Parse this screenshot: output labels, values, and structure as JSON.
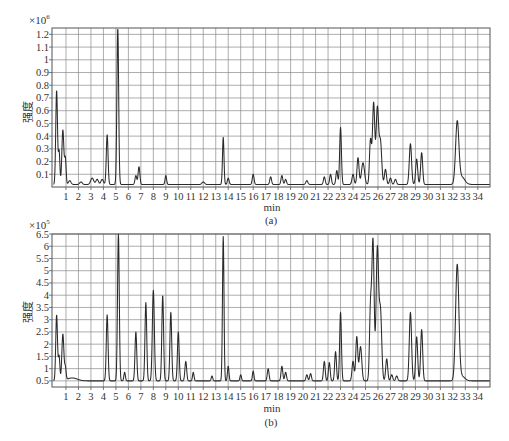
{
  "figure": {
    "panels": [
      {
        "id": "a",
        "caption": "(a)",
        "xlabel": "min",
        "ylabel": "强度",
        "y_multiplier": "×10",
        "y_exponent": "6"
      },
      {
        "id": "b",
        "caption": "(b)",
        "xlabel": "min",
        "ylabel": "强度",
        "y_multiplier": "×10",
        "y_exponent": "5"
      }
    ]
  },
  "chart_data": [
    {
      "type": "line",
      "title": "(a)",
      "xlabel": "min",
      "ylabel": "强度 (×10^6)",
      "xlim": [
        0,
        35
      ],
      "ylim": [
        0,
        1.25
      ],
      "x_ticks": [
        1,
        2,
        3,
        4,
        5,
        6,
        7,
        8,
        9,
        10,
        11,
        12,
        13,
        14,
        15,
        16,
        17,
        18,
        19,
        20,
        21,
        22,
        23,
        24,
        25,
        26,
        27,
        28,
        29,
        30,
        31,
        32,
        33,
        34
      ],
      "y_ticks": [
        0.1,
        0.2,
        0.3,
        0.4,
        0.5,
        0.6,
        0.7,
        0.8,
        0.9,
        1,
        1.1,
        1.2
      ],
      "grid": true,
      "baseline": 0.02,
      "peaks": [
        {
          "x": 0.25,
          "y": 0.76,
          "w": 0.07
        },
        {
          "x": 0.45,
          "y": 0.28,
          "w": 0.06
        },
        {
          "x": 0.75,
          "y": 0.45,
          "w": 0.08
        },
        {
          "x": 0.95,
          "y": 0.22,
          "w": 0.06
        },
        {
          "x": 1.3,
          "y": 0.05,
          "w": 0.1
        },
        {
          "x": 2.2,
          "y": 0.04,
          "w": 0.1
        },
        {
          "x": 3.1,
          "y": 0.07,
          "w": 0.12
        },
        {
          "x": 3.5,
          "y": 0.06,
          "w": 0.1
        },
        {
          "x": 3.9,
          "y": 0.06,
          "w": 0.1
        },
        {
          "x": 4.3,
          "y": 0.41,
          "w": 0.07
        },
        {
          "x": 5.15,
          "y": 1.25,
          "w": 0.07
        },
        {
          "x": 6.6,
          "y": 0.09,
          "w": 0.07
        },
        {
          "x": 6.85,
          "y": 0.16,
          "w": 0.07
        },
        {
          "x": 9.0,
          "y": 0.09,
          "w": 0.06
        },
        {
          "x": 12.0,
          "y": 0.04,
          "w": 0.1
        },
        {
          "x": 13.6,
          "y": 0.39,
          "w": 0.06
        },
        {
          "x": 14.0,
          "y": 0.07,
          "w": 0.07
        },
        {
          "x": 16.0,
          "y": 0.1,
          "w": 0.07
        },
        {
          "x": 17.4,
          "y": 0.08,
          "w": 0.07
        },
        {
          "x": 18.3,
          "y": 0.09,
          "w": 0.07
        },
        {
          "x": 18.6,
          "y": 0.06,
          "w": 0.07
        },
        {
          "x": 20.3,
          "y": 0.05,
          "w": 0.08
        },
        {
          "x": 21.7,
          "y": 0.08,
          "w": 0.07
        },
        {
          "x": 22.2,
          "y": 0.1,
          "w": 0.07
        },
        {
          "x": 22.7,
          "y": 0.13,
          "w": 0.07
        },
        {
          "x": 23.0,
          "y": 0.47,
          "w": 0.07
        },
        {
          "x": 24.0,
          "y": 0.1,
          "w": 0.08
        },
        {
          "x": 24.4,
          "y": 0.23,
          "w": 0.08
        },
        {
          "x": 24.8,
          "y": 0.19,
          "w": 0.12
        },
        {
          "x": 25.4,
          "y": 0.37,
          "w": 0.08
        },
        {
          "x": 25.65,
          "y": 0.66,
          "w": 0.09
        },
        {
          "x": 25.95,
          "y": 0.62,
          "w": 0.1
        },
        {
          "x": 26.2,
          "y": 0.35,
          "w": 0.1
        },
        {
          "x": 26.6,
          "y": 0.14,
          "w": 0.08
        },
        {
          "x": 27.0,
          "y": 0.07,
          "w": 0.08
        },
        {
          "x": 27.4,
          "y": 0.06,
          "w": 0.08
        },
        {
          "x": 28.6,
          "y": 0.34,
          "w": 0.09
        },
        {
          "x": 29.1,
          "y": 0.22,
          "w": 0.08
        },
        {
          "x": 29.5,
          "y": 0.27,
          "w": 0.08
        },
        {
          "x": 32.35,
          "y": 0.5,
          "w": 0.13
        },
        {
          "x": 32.7,
          "y": 0.08,
          "w": 0.25
        }
      ]
    },
    {
      "type": "line",
      "title": "(b)",
      "xlabel": "min",
      "ylabel": "强度 (×10^5)",
      "xlim": [
        0,
        35
      ],
      "ylim": [
        0.25,
        6.5
      ],
      "x_ticks": [
        1,
        2,
        3,
        4,
        5,
        6,
        7,
        8,
        9,
        10,
        11,
        12,
        13,
        14,
        15,
        16,
        17,
        18,
        19,
        20,
        21,
        22,
        23,
        24,
        25,
        26,
        27,
        28,
        29,
        30,
        31,
        32,
        33,
        34
      ],
      "y_ticks": [
        0.5,
        1,
        1.5,
        2,
        2.5,
        3,
        3.5,
        4,
        4.5,
        5,
        5.5,
        6,
        6.5
      ],
      "grid": true,
      "baseline": 0.5,
      "peaks": [
        {
          "x": 0.25,
          "y": 3.2,
          "w": 0.07
        },
        {
          "x": 0.45,
          "y": 1.5,
          "w": 0.06
        },
        {
          "x": 0.75,
          "y": 2.4,
          "w": 0.08
        },
        {
          "x": 0.95,
          "y": 1.0,
          "w": 0.06
        },
        {
          "x": 1.5,
          "y": 0.62,
          "w": 0.4
        },
        {
          "x": 4.3,
          "y": 3.2,
          "w": 0.07
        },
        {
          "x": 5.2,
          "y": 6.5,
          "w": 0.07
        },
        {
          "x": 5.7,
          "y": 0.85,
          "w": 0.06
        },
        {
          "x": 6.6,
          "y": 2.5,
          "w": 0.07
        },
        {
          "x": 7.4,
          "y": 3.7,
          "w": 0.07
        },
        {
          "x": 8.0,
          "y": 4.2,
          "w": 0.08
        },
        {
          "x": 8.75,
          "y": 4.0,
          "w": 0.07
        },
        {
          "x": 9.4,
          "y": 3.3,
          "w": 0.07
        },
        {
          "x": 10.0,
          "y": 2.5,
          "w": 0.07
        },
        {
          "x": 10.6,
          "y": 1.3,
          "w": 0.07
        },
        {
          "x": 11.2,
          "y": 0.85,
          "w": 0.06
        },
        {
          "x": 12.7,
          "y": 0.7,
          "w": 0.06
        },
        {
          "x": 13.6,
          "y": 6.4,
          "w": 0.06
        },
        {
          "x": 14.0,
          "y": 1.1,
          "w": 0.06
        },
        {
          "x": 15.0,
          "y": 0.75,
          "w": 0.06
        },
        {
          "x": 16.0,
          "y": 0.9,
          "w": 0.06
        },
        {
          "x": 17.2,
          "y": 1.0,
          "w": 0.07
        },
        {
          "x": 18.3,
          "y": 1.1,
          "w": 0.07
        },
        {
          "x": 18.6,
          "y": 0.85,
          "w": 0.07
        },
        {
          "x": 20.3,
          "y": 0.75,
          "w": 0.07
        },
        {
          "x": 20.6,
          "y": 0.8,
          "w": 0.07
        },
        {
          "x": 21.7,
          "y": 1.3,
          "w": 0.07
        },
        {
          "x": 22.1,
          "y": 1.25,
          "w": 0.07
        },
        {
          "x": 22.6,
          "y": 1.7,
          "w": 0.07
        },
        {
          "x": 23.0,
          "y": 3.3,
          "w": 0.07
        },
        {
          "x": 24.0,
          "y": 1.3,
          "w": 0.08
        },
        {
          "x": 24.3,
          "y": 2.3,
          "w": 0.08
        },
        {
          "x": 24.6,
          "y": 1.9,
          "w": 0.1
        },
        {
          "x": 25.4,
          "y": 3.4,
          "w": 0.08
        },
        {
          "x": 25.6,
          "y": 6.2,
          "w": 0.09
        },
        {
          "x": 25.95,
          "y": 5.9,
          "w": 0.1
        },
        {
          "x": 26.2,
          "y": 3.3,
          "w": 0.1
        },
        {
          "x": 26.7,
          "y": 1.4,
          "w": 0.08
        },
        {
          "x": 27.1,
          "y": 0.75,
          "w": 0.08
        },
        {
          "x": 27.5,
          "y": 0.7,
          "w": 0.08
        },
        {
          "x": 28.6,
          "y": 3.3,
          "w": 0.09
        },
        {
          "x": 29.1,
          "y": 2.3,
          "w": 0.08
        },
        {
          "x": 29.5,
          "y": 2.6,
          "w": 0.08
        },
        {
          "x": 32.35,
          "y": 5.2,
          "w": 0.13
        },
        {
          "x": 32.7,
          "y": 0.7,
          "w": 0.25
        }
      ]
    }
  ]
}
